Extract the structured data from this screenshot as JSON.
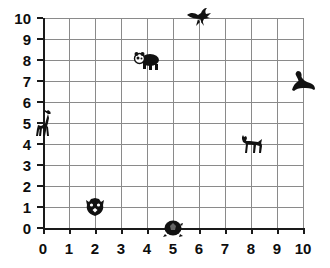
{
  "chart_data": {
    "type": "scatter",
    "title": "",
    "xlabel": "",
    "ylabel": "",
    "xlim": [
      0,
      10
    ],
    "ylim": [
      0,
      10
    ],
    "grid": true,
    "legend": "none",
    "x_ticks": [
      "0",
      "1",
      "2",
      "3",
      "4",
      "5",
      "6",
      "7",
      "8",
      "9",
      "10"
    ],
    "y_ticks": [
      "0",
      "1",
      "2",
      "3",
      "4",
      "5",
      "6",
      "7",
      "8",
      "9",
      "10"
    ],
    "points": [
      {
        "label": "bird",
        "icon": "bird-icon",
        "x": 6,
        "y": 10
      },
      {
        "label": "panda",
        "icon": "panda-icon",
        "x": 4,
        "y": 8
      },
      {
        "label": "seal",
        "icon": "seal-icon",
        "x": 10,
        "y": 7
      },
      {
        "label": "giraffe",
        "icon": "giraffe-icon",
        "x": 0,
        "y": 5
      },
      {
        "label": "zebra",
        "icon": "zebra-icon",
        "x": 8,
        "y": 4
      },
      {
        "label": "tiger",
        "icon": "tiger-icon",
        "x": 2,
        "y": 1
      },
      {
        "label": "turtle",
        "icon": "turtle-icon",
        "x": 5,
        "y": 0
      }
    ]
  },
  "colors": {
    "background": "#ffffff",
    "gridline": "#8a8a8a",
    "axis": "#1a1a1a",
    "label": "#0d0d0d",
    "marker": "#111111"
  }
}
